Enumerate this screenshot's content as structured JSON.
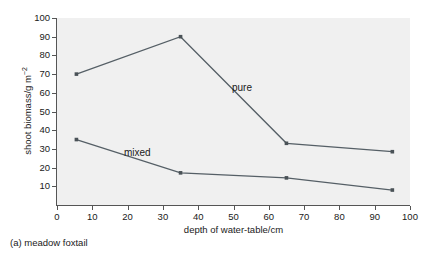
{
  "caption": "(a) meadow foxtail",
  "colors": {
    "plot_background": "#f0f0f0",
    "page_background": "#ffffff",
    "line": "#555f66",
    "marker": "#4a5257",
    "axis": "#555555",
    "text": "#1a1a1a"
  },
  "axes": {
    "x": {
      "label": "depth of water-table/cm",
      "ticks": [
        0,
        10,
        20,
        30,
        40,
        50,
        60,
        70,
        80,
        90,
        100
      ],
      "tick_labels": [
        "0",
        "10",
        "20",
        "30",
        "40",
        "50",
        "60",
        "70",
        "80",
        "90",
        "100"
      ],
      "min": 0,
      "max": 100
    },
    "y": {
      "label_prefix": "shoot biomass/g m",
      "label_exponent": "−2",
      "label": "shoot biomass/g m⁻²",
      "ticks": [
        10,
        20,
        30,
        40,
        50,
        60,
        70,
        80,
        90,
        100
      ],
      "tick_labels": [
        "10",
        "20",
        "30",
        "40",
        "50",
        "60",
        "70",
        "80",
        "90",
        "100"
      ],
      "min": 0,
      "max": 100
    }
  },
  "annotations": [
    {
      "name": "pure-label",
      "text": "pure",
      "x": 59,
      "y": 66
    },
    {
      "name": "mixed-label",
      "text": "mixed",
      "x": 26,
      "y": 36
    }
  ],
  "chart_data": {
    "type": "line",
    "title": "",
    "subtitle": "",
    "xlabel": "depth of water-table/cm",
    "ylabel": "shoot biomass/g m⁻²",
    "xlim": [
      0,
      100
    ],
    "ylim": [
      0,
      100
    ],
    "grid": false,
    "legend_position": "inline-annotations",
    "x": [
      5.5,
      35,
      65,
      95
    ],
    "series": [
      {
        "name": "pure",
        "x": [
          5.5,
          35,
          65,
          95
        ],
        "values": [
          70,
          90,
          33,
          28.5
        ],
        "marker": "square",
        "color": "#555f66"
      },
      {
        "name": "mixed",
        "x": [
          5.5,
          35,
          65,
          95
        ],
        "values": [
          35,
          17.2,
          14.5,
          8
        ],
        "marker": "square",
        "color": "#555f66"
      }
    ],
    "annotations": [
      {
        "text": "pure",
        "data_x": 59,
        "data_y": 66
      },
      {
        "text": "mixed",
        "data_x": 26,
        "data_y": 36
      }
    ]
  }
}
